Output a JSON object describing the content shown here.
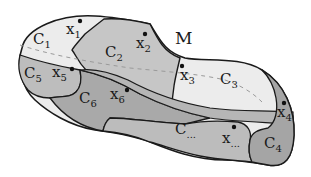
{
  "diagram": {
    "title": "M",
    "colors": {
      "outline": "#1a1a1a",
      "light_region": "#ececec",
      "mid_region": "#c4c4c4",
      "dark_region": "#a9a9a9",
      "band": "#b6b6b6",
      "dashed_curve": "#9a9a9a",
      "background": "#ffffff"
    },
    "regions": [
      {
        "id": "C1",
        "base": "C",
        "sub": "1"
      },
      {
        "id": "C2",
        "base": "C",
        "sub": "2"
      },
      {
        "id": "C3",
        "base": "C",
        "sub": "3"
      },
      {
        "id": "C4",
        "base": "C",
        "sub": "4"
      },
      {
        "id": "C5",
        "base": "C",
        "sub": "5"
      },
      {
        "id": "C6",
        "base": "C",
        "sub": "6"
      },
      {
        "id": "C...",
        "base": "C",
        "sub": "..."
      }
    ],
    "points": [
      {
        "id": "x1",
        "base": "x",
        "sub": "1"
      },
      {
        "id": "x2",
        "base": "x",
        "sub": "2"
      },
      {
        "id": "x3",
        "base": "x",
        "sub": "3"
      },
      {
        "id": "x4",
        "base": "x",
        "sub": "4"
      },
      {
        "id": "x5",
        "base": "x",
        "sub": "5"
      },
      {
        "id": "x6",
        "base": "x",
        "sub": "6"
      },
      {
        "id": "x...",
        "base": "x",
        "sub": "..."
      }
    ]
  }
}
